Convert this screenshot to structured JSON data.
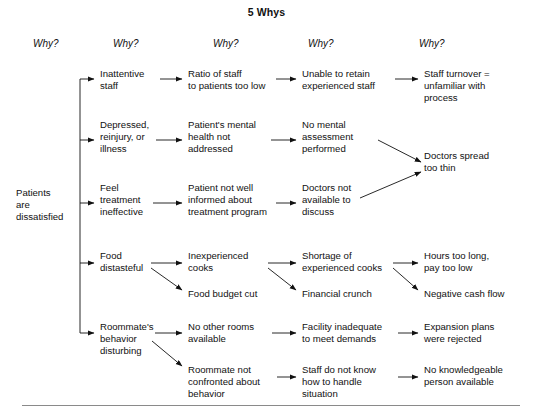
{
  "title": "5 Whys",
  "why_headers": [
    {
      "label": "Why?",
      "x": 33,
      "y": 38
    },
    {
      "label": "Why?",
      "x": 113,
      "y": 38
    },
    {
      "label": "Why?",
      "x": 213,
      "y": 38
    },
    {
      "label": "Why?",
      "x": 308,
      "y": 38
    },
    {
      "label": "Why?",
      "x": 419,
      "y": 38
    }
  ],
  "root": {
    "label": "Patients\nare\ndissatisfied",
    "x": 16,
    "y": 187
  },
  "nodes": [
    {
      "id": "inattentive-staff",
      "label": "Inattentive\nstaff",
      "x": 100,
      "y": 68,
      "col": 2
    },
    {
      "id": "ratio-of-staff",
      "label": "Ratio of staff\nto patients too low",
      "x": 188,
      "y": 68,
      "col": 3
    },
    {
      "id": "unable-to-retain",
      "label": "Unable to retain\nexperienced staff",
      "x": 302,
      "y": 68,
      "col": 4
    },
    {
      "id": "staff-turnover",
      "label": "Staff turnover =\nunfamiliar with\nprocess",
      "x": 424,
      "y": 68,
      "col": 5
    },
    {
      "id": "depressed-reinjury",
      "label": "Depressed,\nreinjury, or\nillness",
      "x": 100,
      "y": 119,
      "col": 2
    },
    {
      "id": "mental-health-not-addressed",
      "label": "Patient's mental\nhealth not\naddressed",
      "x": 188,
      "y": 119,
      "col": 3
    },
    {
      "id": "no-mental-assessment",
      "label": "No mental\nassessment\nperformed",
      "x": 302,
      "y": 119,
      "col": 4
    },
    {
      "id": "feel-treatment-ineffective",
      "label": "Feel\ntreatment\nineffective",
      "x": 100,
      "y": 182,
      "col": 2
    },
    {
      "id": "patient-not-informed",
      "label": "Patient not well\ninformed about\ntreatment program",
      "x": 188,
      "y": 182,
      "col": 3
    },
    {
      "id": "doctors-not-available",
      "label": "Doctors not\navailable to\ndiscuss",
      "x": 302,
      "y": 182,
      "col": 4
    },
    {
      "id": "doctors-spread-too-thin",
      "label": "Doctors spread\ntoo thin",
      "x": 424,
      "y": 150,
      "col": 5
    },
    {
      "id": "food-distasteful",
      "label": "Food\ndistasteful",
      "x": 100,
      "y": 250,
      "col": 2
    },
    {
      "id": "inexperienced-cooks",
      "label": "Inexperienced\ncooks",
      "x": 188,
      "y": 250,
      "col": 3
    },
    {
      "id": "shortage-experienced-cooks",
      "label": "Shortage of\nexperienced cooks",
      "x": 302,
      "y": 250,
      "col": 4
    },
    {
      "id": "hours-too-long",
      "label": "Hours too long,\npay too low",
      "x": 424,
      "y": 250,
      "col": 5
    },
    {
      "id": "food-budget-cut",
      "label": "Food budget cut",
      "x": 188,
      "y": 288,
      "col": 3
    },
    {
      "id": "financial-crunch",
      "label": "Financial crunch",
      "x": 302,
      "y": 288,
      "col": 4
    },
    {
      "id": "negative-cash-flow",
      "label": "Negative cash flow",
      "x": 424,
      "y": 288,
      "col": 5
    },
    {
      "id": "roommate-behavior",
      "label": "Roommate's\nbehavior\ndisturbing",
      "x": 100,
      "y": 321,
      "col": 2
    },
    {
      "id": "no-other-rooms",
      "label": "No other rooms\navailable",
      "x": 188,
      "y": 321,
      "col": 3
    },
    {
      "id": "facility-inadequate",
      "label": "Facility inadequate\nto meet demands",
      "x": 302,
      "y": 321,
      "col": 4
    },
    {
      "id": "expansion-plans-rejected",
      "label": "Expansion plans\nwere rejected",
      "x": 424,
      "y": 321,
      "col": 5
    },
    {
      "id": "roommate-not-confronted",
      "label": "Roommate not\nconfronted about\nbehavior",
      "x": 188,
      "y": 364,
      "col": 3
    },
    {
      "id": "staff-do-not-know",
      "label": "Staff do not know\nhow to handle\nsituation",
      "x": 302,
      "y": 364,
      "col": 4
    },
    {
      "id": "no-knowledgeable-person",
      "label": "No knowledgeable\nperson available",
      "x": 424,
      "y": 364,
      "col": 5
    }
  ],
  "colors": {
    "ink": "#111111",
    "rule": "#8a8a8a"
  }
}
